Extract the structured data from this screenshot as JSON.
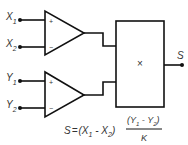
{
  "diagram": {
    "title": "",
    "inputs": [
      {
        "name": "X",
        "sub": "1"
      },
      {
        "name": "X",
        "sub": "2"
      },
      {
        "name": "Y",
        "sub": "1"
      },
      {
        "name": "Y",
        "sub": "2"
      }
    ],
    "amplifiers": [
      {
        "plus": "+",
        "minus": "−"
      },
      {
        "plus": "+",
        "minus": "−"
      }
    ],
    "multiplier": {
      "label": "×"
    },
    "output": {
      "label": "S"
    },
    "formula": {
      "lhs": "S",
      "eq": "=",
      "open": "(X",
      "sub1": "1",
      "minus": " - X",
      "sub2": "2",
      "close": ")",
      "num_open": "(Y",
      "num_sub1": "1",
      "num_minus": " - Y",
      "num_sub2": "2",
      "num_close": ")",
      "den": "K"
    },
    "line_color": "#111111"
  }
}
